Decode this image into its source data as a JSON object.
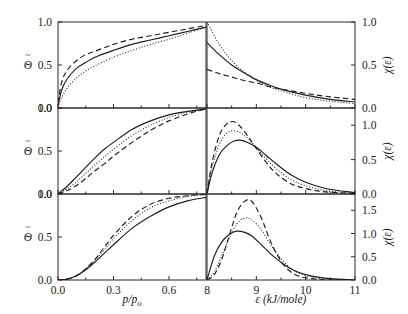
{
  "figure": {
    "width": 408,
    "height": 314,
    "background": "#ffffff",
    "ink_color": "#1d1d1d"
  },
  "axes_titles": {
    "left_x": "p/p",
    "left_x_sub": "o",
    "left_y": "Θ",
    "left_y_accent": "~",
    "right_x": "ε (kJ/mole)",
    "right_y": "χ(ε)"
  },
  "panels": [
    {
      "id": "F",
      "label": "F",
      "row": 0,
      "left": {
        "ylim": [
          0.0,
          1.0
        ],
        "yticks": [
          0.0,
          0.5,
          1.0
        ],
        "ytick_labels": [
          "0.0",
          "0.5",
          "1.0"
        ]
      },
      "right": {
        "ylim": [
          0.0,
          1.0
        ],
        "yticks": [
          0.0,
          0.5,
          1.0
        ],
        "ytick_labels": [
          "0.0",
          "0.5",
          "1.0"
        ]
      }
    },
    {
      "id": "DR",
      "label": "DR",
      "row": 1,
      "left": {
        "ylim": [
          0.0,
          1.0
        ],
        "yticks": [
          0.0,
          0.5,
          1.0
        ],
        "ytick_labels": [
          "0.0",
          "0.5",
          "1.0"
        ]
      },
      "right": {
        "ylim": [
          0.0,
          1.25
        ],
        "yticks": [
          0.0,
          0.5,
          1.0
        ],
        "ytick_labels": [
          "0.0",
          "0.5",
          "1.0"
        ]
      }
    },
    {
      "id": "DA",
      "label": "DA",
      "row": 2,
      "left": {
        "ylim": [
          0.0,
          1.0
        ],
        "yticks": [
          0.0,
          0.5,
          1.0
        ],
        "ytick_labels": [
          "0.0",
          "0.5",
          "1.0"
        ]
      },
      "right": {
        "ylim": [
          0.0,
          1.85
        ],
        "yticks": [
          0.0,
          0.5,
          1.0,
          1.5
        ],
        "ytick_labels": [
          "0.0",
          "0.5",
          "1.0",
          "1.5"
        ]
      }
    }
  ],
  "left_x_axis": {
    "xlim": [
      0.0,
      0.8
    ],
    "ticks": [
      0.0,
      0.3,
      0.6
    ],
    "tick_labels": [
      "0.0",
      "0.3",
      "0.6"
    ],
    "minor_ticks": [
      0.15,
      0.45,
      0.75
    ]
  },
  "right_x_axis": {
    "xlim": [
      8.0,
      11.0
    ],
    "ticks": [
      8,
      9,
      10,
      11
    ],
    "tick_labels": [
      "8",
      "9",
      "10",
      "11"
    ]
  },
  "chart_data": {
    "type": "line",
    "title": "",
    "n_panels": 6,
    "layout": "3 rows x 2 columns",
    "shared": {
      "left_xlabel": "p/po",
      "left_ylabel": "Θ~",
      "right_xlabel": "ε (kJ/mole)",
      "right_ylabel": "χ(ε)",
      "grid": false,
      "legend": false,
      "line_styles": [
        "solid",
        "dashed",
        "dotted"
      ]
    },
    "panels": [
      {
        "name": "F",
        "left_plot": {
          "xlabel": "p/po",
          "ylabel": "Θ~",
          "xlim": [
            0.0,
            0.8
          ],
          "ylim": [
            0.0,
            1.0
          ],
          "series": [
            {
              "name": "solid",
              "style": "solid",
              "x": [
                0.0,
                0.02,
                0.05,
                0.1,
                0.15,
                0.2,
                0.3,
                0.4,
                0.5,
                0.6,
                0.7,
                0.8
              ],
              "y": [
                0.03,
                0.21,
                0.34,
                0.46,
                0.53,
                0.59,
                0.67,
                0.74,
                0.79,
                0.84,
                0.89,
                0.94
              ]
            },
            {
              "name": "dashed",
              "style": "dashed",
              "x": [
                0.0,
                0.02,
                0.05,
                0.1,
                0.15,
                0.2,
                0.3,
                0.4,
                0.5,
                0.6,
                0.7,
                0.8
              ],
              "y": [
                0.06,
                0.3,
                0.44,
                0.55,
                0.62,
                0.66,
                0.74,
                0.8,
                0.84,
                0.88,
                0.92,
                0.96
              ]
            },
            {
              "name": "dotted",
              "style": "dotted",
              "x": [
                0.0,
                0.02,
                0.05,
                0.1,
                0.15,
                0.2,
                0.3,
                0.4,
                0.5,
                0.6,
                0.7,
                0.8
              ],
              "y": [
                0.01,
                0.12,
                0.23,
                0.35,
                0.43,
                0.49,
                0.59,
                0.67,
                0.74,
                0.8,
                0.87,
                0.94
              ]
            }
          ]
        },
        "right_plot": {
          "xlabel": "ε (kJ/mole)",
          "ylabel": "χ(ε)",
          "xlim": [
            8.0,
            11.0
          ],
          "ylim": [
            0.0,
            1.0
          ],
          "series": [
            {
              "name": "solid",
              "style": "solid",
              "x": [
                8.0,
                8.25,
                8.5,
                8.75,
                9.0,
                9.25,
                9.5,
                10.0,
                10.5,
                11.0
              ],
              "y": [
                0.76,
                0.62,
                0.5,
                0.41,
                0.33,
                0.27,
                0.22,
                0.15,
                0.1,
                0.07
              ]
            },
            {
              "name": "dashed",
              "style": "dashed",
              "x": [
                8.0,
                8.25,
                8.5,
                8.75,
                9.0,
                9.25,
                9.5,
                10.0,
                10.5,
                11.0
              ],
              "y": [
                0.45,
                0.4,
                0.36,
                0.32,
                0.29,
                0.25,
                0.22,
                0.17,
                0.13,
                0.1
              ]
            },
            {
              "name": "dotted",
              "style": "dotted",
              "x": [
                8.0,
                8.25,
                8.5,
                8.75,
                9.0,
                9.25,
                9.5,
                10.0,
                10.5,
                11.0
              ],
              "y": [
                1.0,
                0.74,
                0.55,
                0.42,
                0.32,
                0.25,
                0.2,
                0.12,
                0.08,
                0.05
              ]
            }
          ]
        }
      },
      {
        "name": "DR",
        "left_plot": {
          "xlabel": "p/po",
          "ylabel": "Θ~",
          "xlim": [
            0.0,
            0.8
          ],
          "ylim": [
            0.0,
            1.0
          ],
          "series": [
            {
              "name": "solid",
              "style": "solid",
              "x": [
                0.0,
                0.05,
                0.1,
                0.15,
                0.2,
                0.25,
                0.3,
                0.4,
                0.5,
                0.6,
                0.7,
                0.8
              ],
              "y": [
                0.0,
                0.09,
                0.2,
                0.31,
                0.42,
                0.52,
                0.6,
                0.75,
                0.85,
                0.92,
                0.96,
                0.99
              ]
            },
            {
              "name": "dashed",
              "style": "dashed",
              "x": [
                0.0,
                0.05,
                0.1,
                0.15,
                0.2,
                0.25,
                0.3,
                0.4,
                0.5,
                0.6,
                0.7,
                0.8
              ],
              "y": [
                0.0,
                0.04,
                0.1,
                0.18,
                0.27,
                0.35,
                0.44,
                0.6,
                0.74,
                0.85,
                0.93,
                0.99
              ]
            },
            {
              "name": "dotted",
              "style": "dotted",
              "x": [
                0.0,
                0.05,
                0.1,
                0.15,
                0.2,
                0.25,
                0.3,
                0.4,
                0.5,
                0.6,
                0.7,
                0.8
              ],
              "y": [
                0.0,
                0.06,
                0.14,
                0.24,
                0.34,
                0.43,
                0.52,
                0.68,
                0.8,
                0.89,
                0.95,
                0.99
              ]
            }
          ]
        },
        "right_plot": {
          "xlabel": "ε (kJ/mole)",
          "ylabel": "χ(ε)",
          "xlim": [
            8.0,
            11.0
          ],
          "ylim": [
            0.0,
            1.25
          ],
          "peaks": {
            "solid": 0.78,
            "dashed": 1.05,
            "dotted": 0.92
          },
          "series": [
            {
              "name": "solid",
              "style": "solid",
              "x": [
                8.0,
                8.1,
                8.25,
                8.4,
                8.55,
                8.7,
                8.85,
                9.0,
                9.2,
                9.4,
                9.7,
                10.0,
                10.4,
                11.0
              ],
              "y": [
                0.0,
                0.3,
                0.57,
                0.7,
                0.77,
                0.78,
                0.74,
                0.68,
                0.56,
                0.44,
                0.28,
                0.17,
                0.08,
                0.02
              ]
            },
            {
              "name": "dashed",
              "style": "dashed",
              "x": [
                8.0,
                8.1,
                8.25,
                8.4,
                8.55,
                8.7,
                8.85,
                9.0,
                9.2,
                9.4,
                9.7,
                10.0,
                10.4,
                11.0
              ],
              "y": [
                0.0,
                0.45,
                0.85,
                1.02,
                1.05,
                0.96,
                0.82,
                0.66,
                0.46,
                0.3,
                0.15,
                0.08,
                0.03,
                0.01
              ]
            },
            {
              "name": "dotted",
              "style": "dotted",
              "x": [
                8.0,
                8.1,
                8.25,
                8.4,
                8.55,
                8.7,
                8.85,
                9.0,
                9.2,
                9.4,
                9.7,
                10.0,
                10.4,
                11.0
              ],
              "y": [
                0.0,
                0.38,
                0.72,
                0.88,
                0.92,
                0.88,
                0.79,
                0.67,
                0.51,
                0.37,
                0.21,
                0.12,
                0.05,
                0.01
              ]
            }
          ]
        }
      },
      {
        "name": "DA",
        "left_plot": {
          "xlabel": "p/po",
          "ylabel": "Θ~",
          "xlim": [
            0.0,
            0.8
          ],
          "ylim": [
            0.0,
            1.0
          ],
          "series": [
            {
              "name": "solid",
              "style": "solid",
              "x": [
                0.0,
                0.05,
                0.1,
                0.15,
                0.2,
                0.25,
                0.3,
                0.4,
                0.5,
                0.6,
                0.7,
                0.8
              ],
              "y": [
                0.0,
                0.01,
                0.05,
                0.12,
                0.21,
                0.31,
                0.41,
                0.6,
                0.74,
                0.85,
                0.92,
                0.96
              ]
            },
            {
              "name": "dashed",
              "style": "dashed",
              "x": [
                0.0,
                0.05,
                0.1,
                0.15,
                0.2,
                0.25,
                0.3,
                0.4,
                0.5,
                0.6,
                0.7,
                0.8
              ],
              "y": [
                0.0,
                0.01,
                0.05,
                0.13,
                0.24,
                0.38,
                0.52,
                0.74,
                0.88,
                0.95,
                0.98,
                1.0
              ]
            },
            {
              "name": "dotted",
              "style": "dotted",
              "x": [
                0.0,
                0.05,
                0.1,
                0.15,
                0.2,
                0.25,
                0.3,
                0.4,
                0.5,
                0.6,
                0.7,
                0.8
              ],
              "y": [
                0.0,
                0.01,
                0.05,
                0.13,
                0.23,
                0.35,
                0.48,
                0.69,
                0.84,
                0.92,
                0.97,
                0.99
              ]
            }
          ]
        },
        "right_plot": {
          "xlabel": "ε (kJ/mole)",
          "ylabel": "χ(ε)",
          "xlim": [
            8.0,
            11.0
          ],
          "ylim": [
            0.0,
            1.85
          ],
          "peaks": {
            "solid": 1.05,
            "dashed": 1.7,
            "dotted": 1.35
          },
          "series": [
            {
              "name": "solid",
              "style": "solid",
              "x": [
                8.0,
                8.15,
                8.3,
                8.45,
                8.6,
                8.75,
                8.9,
                9.1,
                9.3,
                9.55,
                9.8,
                10.1,
                10.5,
                11.0
              ],
              "y": [
                0.0,
                0.52,
                0.82,
                0.98,
                1.05,
                1.03,
                0.95,
                0.76,
                0.55,
                0.34,
                0.19,
                0.09,
                0.03,
                0.0
              ]
            },
            {
              "name": "dashed",
              "style": "dashed",
              "x": [
                8.0,
                8.15,
                8.3,
                8.45,
                8.6,
                8.75,
                8.9,
                9.1,
                9.3,
                9.55,
                9.8,
                10.1,
                10.5,
                11.0
              ],
              "y": [
                0.0,
                0.12,
                0.45,
                0.95,
                1.44,
                1.68,
                1.7,
                1.34,
                0.8,
                0.33,
                0.11,
                0.03,
                0.0,
                0.0
              ]
            },
            {
              "name": "dotted",
              "style": "dotted",
              "x": [
                8.0,
                8.15,
                8.3,
                8.45,
                8.6,
                8.75,
                8.9,
                9.1,
                9.3,
                9.55,
                9.8,
                10.1,
                10.5,
                11.0
              ],
              "y": [
                0.0,
                0.18,
                0.52,
                0.9,
                1.2,
                1.33,
                1.3,
                1.08,
                0.74,
                0.4,
                0.18,
                0.07,
                0.01,
                0.0
              ]
            }
          ]
        }
      }
    ]
  }
}
